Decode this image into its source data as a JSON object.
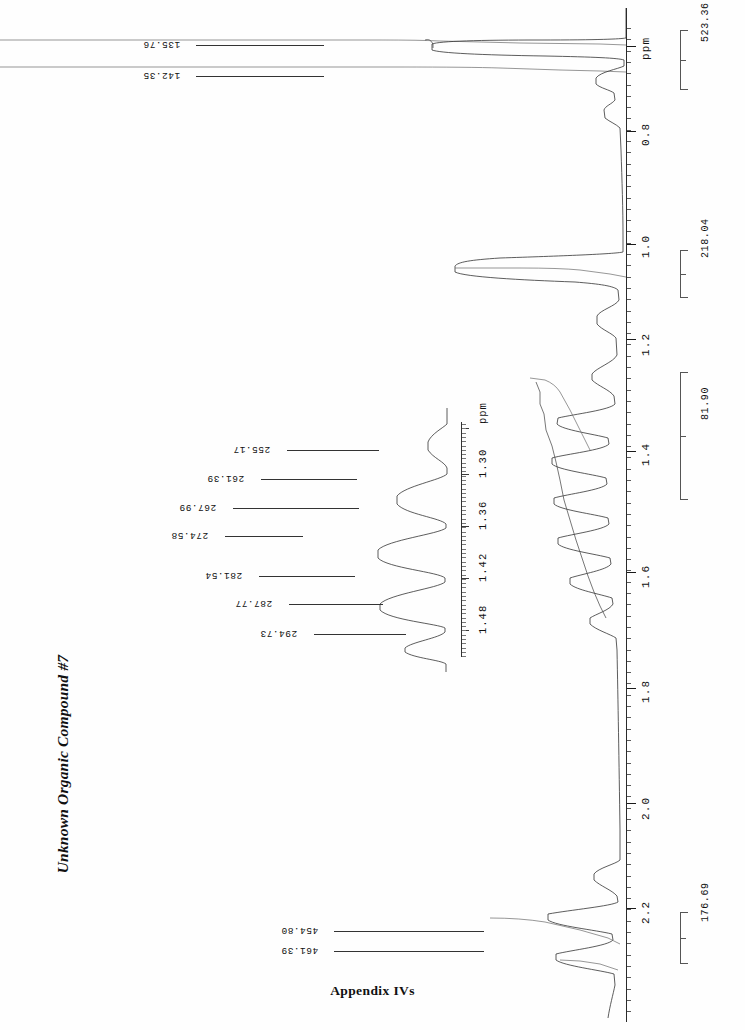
{
  "document": {
    "title": "Unknown Organic Compound #7",
    "caption": "Appendix IVs"
  },
  "main_axis": {
    "unit_label": "ppm",
    "tick_labels": [
      "0.8",
      "1.0",
      "1.2",
      "1.4",
      "1.6",
      "1.8",
      "2.0",
      "2.2"
    ]
  },
  "integrals": [
    {
      "value": "523.36"
    },
    {
      "value": "218.04"
    },
    {
      "value": "81.90"
    },
    {
      "value": "176.69"
    }
  ],
  "peak_labels_top": [
    {
      "value": "135.76"
    },
    {
      "value": "142.35"
    }
  ],
  "peak_labels_bottom": [
    {
      "value": "454.80"
    },
    {
      "value": "461.39"
    }
  ],
  "inset": {
    "unit_label": "ppm",
    "tick_labels": [
      "1.30",
      "1.36",
      "1.42",
      "1.48"
    ],
    "peak_labels": [
      {
        "value": "255.17"
      },
      {
        "value": "261.39"
      },
      {
        "value": "267.99"
      },
      {
        "value": "274.58"
      },
      {
        "value": "281.54"
      },
      {
        "value": "287.77"
      },
      {
        "value": "294.73"
      }
    ]
  },
  "chart_data": {
    "type": "line",
    "title": "Unknown Organic Compound #7",
    "xlabel": "ppm",
    "ylabel": "",
    "orientation": "vertical-axis-right",
    "xlim": [
      0.7,
      2.4
    ],
    "grid": false,
    "legend": null,
    "main_spectrum": {
      "axis_unit": "ppm",
      "axis_tick_values": [
        0.8,
        1.0,
        1.2,
        1.4,
        1.6,
        1.8,
        2.0,
        2.2
      ],
      "peaks_ppm": [
        0.78,
        0.8,
        1.07,
        1.09,
        1.11,
        1.3,
        1.33,
        1.36,
        1.39,
        1.42,
        1.45,
        1.48,
        2.27,
        2.31
      ],
      "annotated_frequencies_hz": [
        135.76,
        142.35,
        454.8,
        461.39
      ],
      "integral_values": [
        523.36,
        218.04,
        81.9,
        176.69
      ],
      "integral_regions_ppm": [
        [
          0.72,
          0.9
        ],
        [
          1.02,
          1.17
        ],
        [
          1.22,
          1.55
        ],
        [
          2.2,
          2.4
        ]
      ]
    },
    "inset_expansion": {
      "axis_unit": "ppm",
      "axis_tick_values": [
        1.3,
        1.36,
        1.42,
        1.48
      ],
      "xlim": [
        1.265,
        1.515
      ],
      "multiplicity": "septet",
      "line_count": 7,
      "frequencies_hz": [
        255.17,
        261.39,
        267.99,
        274.58,
        281.54,
        287.77,
        294.73
      ],
      "relative_intensities": [
        0.18,
        0.52,
        0.85,
        1.0,
        0.8,
        0.44,
        0.14
      ]
    }
  }
}
